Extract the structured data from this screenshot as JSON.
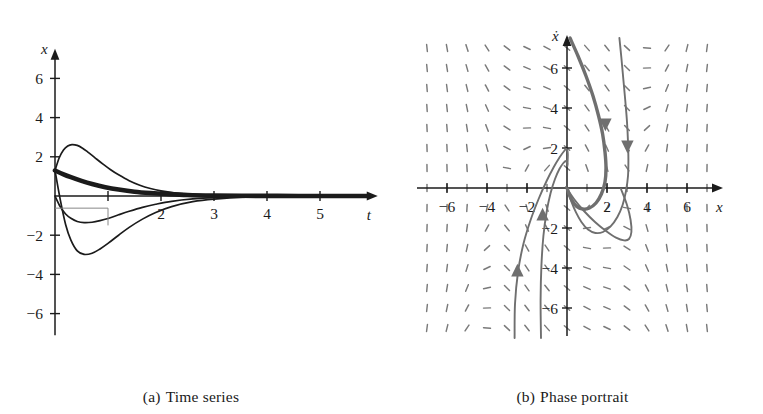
{
  "figure": {
    "background": "#ffffff",
    "ink": "#1b1b1b",
    "trajectory_color": "#6f6f6f",
    "field_color": "#7a7a7a",
    "curve_color": "#1b1b1b"
  },
  "panels": [
    {
      "id": "time-series",
      "caption_tag": "(a)",
      "caption_text": "Time series",
      "xlabel": "t",
      "ylabel": "x",
      "xticks": [
        1,
        2,
        3,
        4,
        5
      ],
      "xtick_labels": [
        "",
        "2",
        "3",
        "4",
        "5"
      ],
      "yticks": [
        -6,
        -4,
        -2,
        2,
        4,
        6
      ],
      "ytick_labels": [
        "−6",
        "−4",
        "−2",
        "2",
        "4",
        "6"
      ],
      "xlim": [
        0,
        5.9
      ],
      "ylim": [
        -7.2,
        7.2
      ]
    },
    {
      "id": "phase-portrait",
      "caption_tag": "(b)",
      "caption_text": "Phase portrait",
      "xlabel": "x",
      "ylabel": "ẋ",
      "xticks": [
        -6,
        -4,
        -2,
        2,
        4,
        6
      ],
      "xtick_labels": [
        "−6",
        "−4",
        "−2",
        "2",
        "4",
        "6"
      ],
      "yticks": [
        -6,
        -4,
        -2,
        2,
        4,
        6
      ],
      "ytick_labels": [
        "−6",
        "−4",
        "−2",
        "2",
        "4",
        "6"
      ],
      "xlim": [
        -7.6,
        7.6
      ],
      "ylim": [
        -7.6,
        7.6
      ],
      "field_type": "direction-field",
      "equilibrium": [
        0,
        0
      ]
    }
  ],
  "chart_data": [
    {
      "type": "line",
      "title": "Time series",
      "xlabel": "t",
      "ylabel": "x",
      "xlim": [
        0,
        5.9
      ],
      "ylim": [
        -7.2,
        7.2
      ],
      "xticks": [
        2,
        3,
        4,
        5
      ],
      "yticks": [
        -6,
        -4,
        -2,
        2,
        4,
        6
      ],
      "grid": false,
      "legend": "none",
      "series": [
        {
          "name": "overshoot-positive",
          "x": [
            0.0,
            0.08,
            0.16,
            0.24,
            0.32,
            0.42,
            0.52,
            0.62,
            0.75,
            0.9,
            1.05,
            1.2,
            1.4,
            1.6,
            1.8,
            2.0,
            2.3,
            2.6,
            3.0,
            3.6,
            4.4,
            5.2,
            5.9
          ],
          "y": [
            1.3,
            1.95,
            2.35,
            2.55,
            2.62,
            2.58,
            2.44,
            2.24,
            1.96,
            1.64,
            1.34,
            1.08,
            0.78,
            0.55,
            0.38,
            0.26,
            0.14,
            0.08,
            0.04,
            0.015,
            0.005,
            0.002,
            0.0
          ]
        },
        {
          "name": "monotone-positive",
          "x": [
            0.0,
            0.1,
            0.2,
            0.35,
            0.5,
            0.7,
            0.9,
            1.1,
            1.35,
            1.6,
            1.9,
            2.2,
            2.6,
            3.0,
            3.6,
            4.4,
            5.2,
            5.9
          ],
          "y": [
            1.3,
            1.18,
            1.06,
            0.9,
            0.76,
            0.6,
            0.47,
            0.37,
            0.27,
            0.19,
            0.12,
            0.08,
            0.04,
            0.02,
            0.008,
            0.003,
            0.001,
            0.0
          ]
        },
        {
          "name": "shallow-negative",
          "x": [
            0.0,
            0.1,
            0.2,
            0.3,
            0.42,
            0.55,
            0.7,
            0.85,
            1.0,
            1.2,
            1.4,
            1.65,
            1.9,
            2.2,
            2.6,
            3.0,
            3.6,
            4.4,
            5.2,
            5.9
          ],
          "y": [
            0.0,
            -0.55,
            -0.92,
            -1.14,
            -1.3,
            -1.36,
            -1.34,
            -1.26,
            -1.15,
            -0.96,
            -0.78,
            -0.58,
            -0.42,
            -0.27,
            -0.15,
            -0.08,
            -0.03,
            -0.01,
            -0.004,
            0.0
          ]
        },
        {
          "name": "overshoot-negative",
          "x": [
            0.0,
            0.1,
            0.2,
            0.3,
            0.42,
            0.55,
            0.7,
            0.85,
            1.0,
            1.2,
            1.4,
            1.65,
            1.9,
            2.2,
            2.6,
            3.0,
            3.6,
            4.4,
            5.2,
            5.9
          ],
          "y": [
            1.3,
            -0.2,
            -1.45,
            -2.25,
            -2.8,
            -2.98,
            -2.92,
            -2.7,
            -2.42,
            -2.0,
            -1.6,
            -1.18,
            -0.84,
            -0.54,
            -0.29,
            -0.16,
            -0.06,
            -0.02,
            -0.006,
            0.0
          ]
        },
        {
          "name": "thick-decay-bundle",
          "x": [
            0.0,
            0.15,
            0.3,
            0.5,
            0.7,
            0.95,
            1.2,
            1.5,
            1.8,
            2.1,
            2.5,
            3.0,
            3.8,
            4.6,
            5.4,
            5.9
          ],
          "y": [
            1.3,
            1.12,
            0.96,
            0.77,
            0.61,
            0.45,
            0.33,
            0.22,
            0.15,
            0.1,
            0.05,
            0.025,
            0.008,
            0.003,
            0.001,
            0.0
          ]
        }
      ]
    },
    {
      "type": "line",
      "title": "Phase portrait",
      "xlabel": "x",
      "ylabel": "ẋ",
      "xlim": [
        -7.6,
        7.6
      ],
      "ylim": [
        -7.6,
        7.6
      ],
      "xticks": [
        -6,
        -4,
        -2,
        2,
        4,
        6
      ],
      "yticks": [
        -6,
        -4,
        -2,
        2,
        4,
        6
      ],
      "grid": false,
      "legend": "none",
      "series": [
        {
          "name": "trajectory-right-descending",
          "x": [
            0.15,
            0.55,
            0.95,
            1.3,
            1.58,
            1.78,
            1.9,
            1.95,
            1.9,
            1.72,
            1.45,
            1.12,
            0.78,
            0.48,
            0.25,
            0.1,
            0.02
          ],
          "y": [
            7.5,
            6.6,
            5.6,
            4.6,
            3.6,
            2.7,
            1.8,
            1.0,
            0.3,
            -0.3,
            -0.75,
            -1.0,
            -1.05,
            -0.92,
            -0.62,
            -0.3,
            -0.05
          ]
        },
        {
          "name": "trajectory-far-right",
          "x": [
            2.62,
            2.72,
            2.82,
            2.92,
            3.0,
            3.05,
            3.07,
            3.05,
            2.95,
            2.78,
            2.52,
            2.18,
            1.8,
            1.42,
            1.05,
            0.72,
            0.45,
            0.22,
            0.06
          ],
          "y": [
            7.5,
            6.5,
            5.4,
            4.3,
            3.3,
            2.3,
            1.4,
            0.6,
            -0.15,
            -0.85,
            -1.45,
            -1.92,
            -2.2,
            -2.25,
            -2.08,
            -1.7,
            -1.22,
            -0.68,
            -0.2
          ]
        },
        {
          "name": "trajectory-loop-upper-left",
          "x": [
            -2.62,
            -2.6,
            -2.45,
            -2.18,
            -1.82,
            -1.42,
            -1.02,
            -0.66,
            -0.36,
            -0.14,
            -0.02,
            0.04,
            0.02
          ],
          "y": [
            -7.5,
            -5.8,
            -4.2,
            -2.8,
            -1.6,
            -0.55,
            0.35,
            1.05,
            1.55,
            1.85,
            1.95,
            1.7,
            1.1
          ]
        },
        {
          "name": "trajectory-loop-inner",
          "x": [
            -1.3,
            -1.32,
            -1.28,
            -1.18,
            -1.02,
            -0.82,
            -0.6,
            -0.38,
            -0.18,
            -0.04,
            0.02
          ],
          "y": [
            -7.5,
            -5.6,
            -3.9,
            -2.4,
            -1.2,
            -0.25,
            0.45,
            0.95,
            1.25,
            1.35,
            1.2
          ]
        },
        {
          "name": "trajectory-big-arc-right",
          "x": [
            -0.05,
            0.35,
            0.85,
            1.4,
            1.95,
            2.45,
            2.85,
            3.1,
            3.22,
            3.18,
            3.0,
            2.7
          ],
          "y": [
            0.05,
            -0.55,
            -1.15,
            -1.7,
            -2.15,
            -2.48,
            -2.62,
            -2.55,
            -2.2,
            -1.6,
            -0.85,
            -0.05
          ]
        }
      ],
      "annotations": [
        {
          "name": "arrow-down-right-a",
          "x": 1.92,
          "y": 3.3,
          "direction": "down"
        },
        {
          "name": "arrow-down-right-b",
          "x": 3.02,
          "y": 2.2,
          "direction": "down"
        },
        {
          "name": "arrow-up-left-a",
          "x": -2.48,
          "y": -4.25,
          "direction": "up"
        },
        {
          "name": "arrow-up-left-b",
          "x": -1.22,
          "y": -1.45,
          "direction": "up"
        }
      ]
    }
  ]
}
